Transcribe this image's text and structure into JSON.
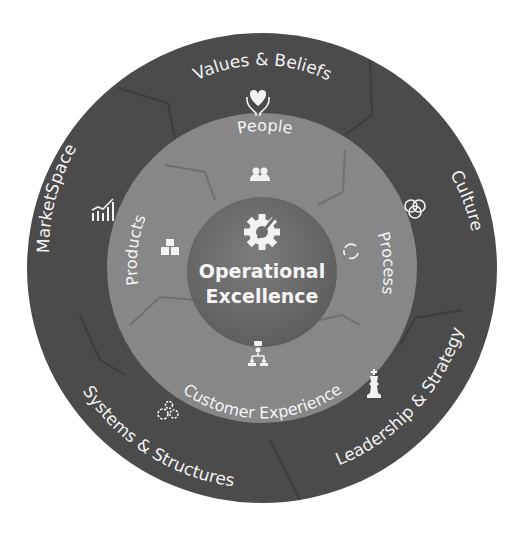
{
  "center": {
    "title_line1": "Operational",
    "title_line2": "Excellence",
    "icon": "gear-wrench-icon"
  },
  "inner_ring": [
    {
      "label": "People",
      "icon": "people-group-icon"
    },
    {
      "label": "Process",
      "icon": "cycle-arrows-icon"
    },
    {
      "label": "Customer Experience",
      "icon": "customer-network-icon"
    },
    {
      "label": "Products",
      "icon": "boxes-icon"
    }
  ],
  "outer_ring": [
    {
      "label": "Values & Beliefs",
      "icon": "heart-hands-icon"
    },
    {
      "label": "Culture",
      "icon": "interlocking-rings-icon"
    },
    {
      "label": "Leadership & Strategy",
      "icon": "chess-king-icon"
    },
    {
      "label": "Systems & Structures",
      "icon": "gears-icon"
    },
    {
      "label": "MarketSpace",
      "icon": "bar-chart-trend-icon"
    }
  ],
  "colors": {
    "outer_ring": "#4b4b4b",
    "outer_ring_edge": "#3e3e3e",
    "inner_ring": "#878787",
    "inner_ring_edge": "#777777",
    "center": "#6e6e6e",
    "text": "#f2f2f2",
    "background": "#ffffff"
  }
}
